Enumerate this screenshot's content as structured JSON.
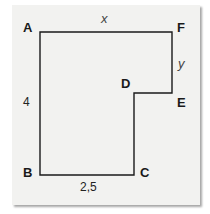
{
  "figure": {
    "type": "L-shaped polygon",
    "vertices": {
      "A": "A",
      "B": "B",
      "C": "C",
      "D": "D",
      "E": "E",
      "F": "F"
    },
    "dimensions": {
      "top_side": "x",
      "right_short_side": "y",
      "left_side": "4",
      "bottom_side": "2,5"
    },
    "colors": {
      "background": "#f2f2f0",
      "line": "#1a1a1a"
    }
  }
}
